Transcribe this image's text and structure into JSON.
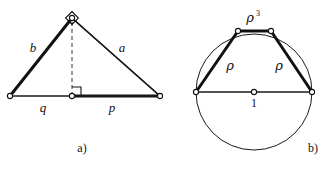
{
  "figure": {
    "ink_color": "#111111",
    "background_color": "#ffffff",
    "panels": [
      {
        "id": "panel-a",
        "caption": "a)",
        "description": "Right triangle with altitude to the hypotenuse",
        "labels": {
          "leg_left": "b",
          "leg_right": "a",
          "segment_left": "q",
          "segment_right": "p"
        },
        "markers": {
          "apex_right_angle": "right-angle-diamond",
          "foot_right_angle": "right-angle-square"
        }
      },
      {
        "id": "panel-b",
        "caption": "b)",
        "description": "Circle of radius 1 with inscribed trapezoid",
        "labels": {
          "top_chord": "ρ",
          "top_chord_exponent": "3",
          "side_left": "ρ",
          "side_right": "ρ",
          "radius": "1"
        }
      }
    ]
  },
  "geometry": {
    "panel_a": {
      "apex": [
        72,
        18
      ],
      "left_vertex": [
        10,
        96
      ],
      "right_vertex": [
        160,
        96
      ],
      "foot": [
        72,
        96
      ]
    },
    "panel_b": {
      "center": [
        254,
        92
      ],
      "radius": 58,
      "left_vertex": [
        196,
        92
      ],
      "right_vertex": [
        312,
        92
      ],
      "top_left_vertex": [
        238,
        31
      ],
      "top_right_vertex": [
        271,
        31
      ]
    }
  }
}
